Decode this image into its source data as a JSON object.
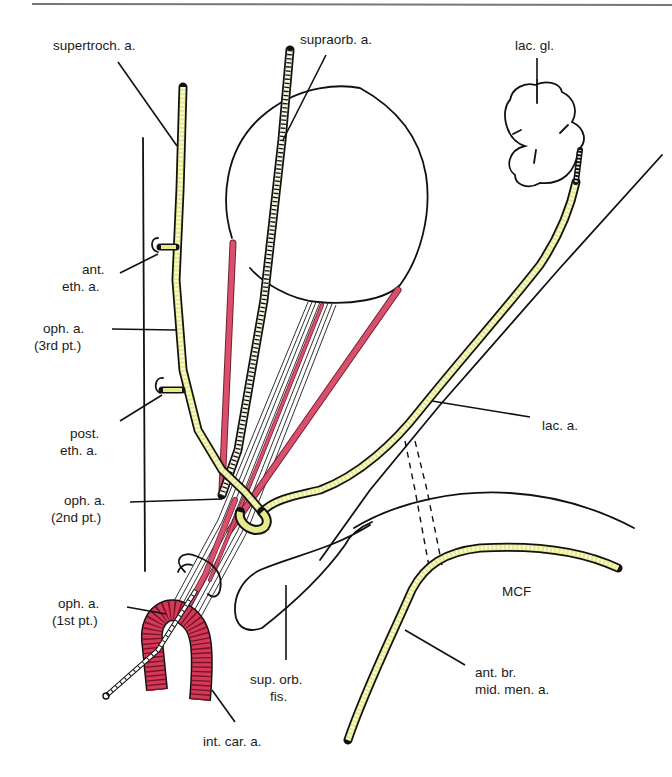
{
  "figure": {
    "colors": {
      "artery_fill": "#e6ea8a",
      "artery_outline": "#111111",
      "muscle_red": "#d8506e",
      "carotid_red": "#d4395a",
      "line": "#111111",
      "rule": "#777777"
    },
    "labels": {
      "supertroch": "supertroch. a.",
      "supraorb": "supraorb. a.",
      "lac_gl": "lac. gl.",
      "ant_eth_1": "ant.",
      "ant_eth_2": "eth. a.",
      "oph3_1": "oph. a.",
      "oph3_2": "(3rd pt.)",
      "post_eth_1": "post.",
      "post_eth_2": "eth. a.",
      "lac_a": "lac. a.",
      "oph2_1": "oph. a.",
      "oph2_2": "(2nd pt.)",
      "oph1_1": "oph. a.",
      "oph1_2": "(1st pt.)",
      "mcf": "MCF",
      "sup_orb_1": "sup. orb.",
      "sup_orb_2": "fis.",
      "ant_br_1": "ant. br.",
      "ant_br_2": "mid. men. a.",
      "int_car": "int. car. a."
    }
  }
}
